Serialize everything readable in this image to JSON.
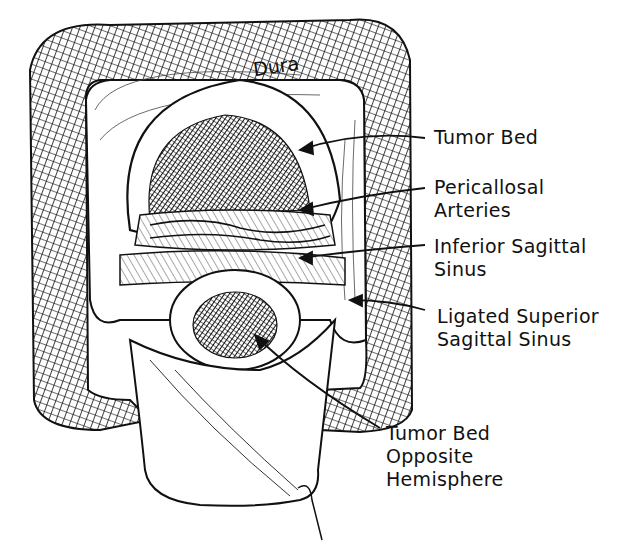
{
  "figure": {
    "type": "surgical illustration (pen-and-ink)",
    "labels": {
      "dura": "Dura",
      "tumor_bed": "Tumor Bed",
      "pericallosal_line1": "Pericallosal",
      "pericallosal_line2": "Arteries",
      "inferior_sinus_line1": "Inferior Sagittal",
      "inferior_sinus_line2": "Sinus",
      "ligated_line1": "Ligated Superior",
      "ligated_line2": "Sagittal Sinus",
      "opposite_line1": "Tumor Bed",
      "opposite_line2": "Opposite",
      "opposite_line3": "Hemisphere"
    },
    "colors": {
      "ink": "#111111",
      "paper": "#ffffff"
    }
  }
}
